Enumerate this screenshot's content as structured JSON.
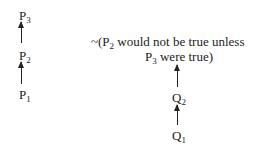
{
  "left_chain": {
    "nodes": [
      {
        "base": "P",
        "sub": "3"
      },
      {
        "base": "P",
        "sub": "2"
      },
      {
        "base": "P",
        "sub": "1"
      }
    ]
  },
  "right_chain": {
    "statement_line1_prefix": "~(P",
    "statement_line1_sub": "2",
    "statement_line1_suffix": " would not be true unless",
    "statement_line2_prefix": "P",
    "statement_line2_sub": "3",
    "statement_line2_suffix": " were true)",
    "nodes": [
      {
        "base": "Q",
        "sub": "2"
      },
      {
        "base": "Q",
        "sub": "1"
      }
    ]
  }
}
